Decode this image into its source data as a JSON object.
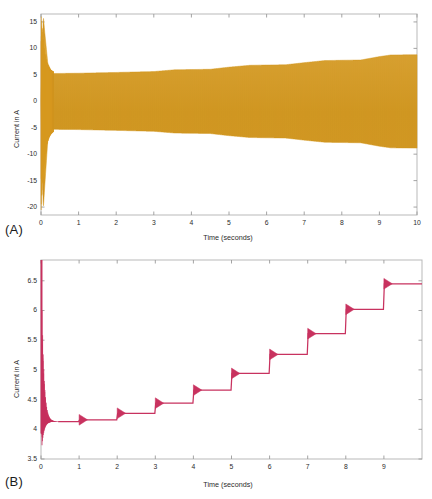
{
  "figure": {
    "background": "#ffffff",
    "panels": [
      {
        "letter": "(A)",
        "name": "panel-a"
      },
      {
        "letter": "(B)",
        "name": "panel-b"
      }
    ]
  },
  "chart_data": [
    {
      "type": "line",
      "panel": "A",
      "title": "",
      "xlabel": "Time (seconds)",
      "ylabel": "Current in A",
      "xlim": [
        0,
        10
      ],
      "ylim": [
        -21.5,
        16.5
      ],
      "xticks": [
        0,
        1,
        2,
        3,
        4,
        5,
        6,
        7,
        8,
        9,
        10
      ],
      "xtick_labels": [
        "0",
        "1",
        "2",
        "3",
        "4",
        "5",
        "6",
        "7",
        "8",
        "9",
        "10"
      ],
      "yticks": [
        15,
        10,
        5,
        0,
        -5,
        -10,
        -15,
        -20
      ],
      "ytick_labels": [
        "15",
        "10",
        "5",
        "0",
        "-5",
        "-10",
        "-15",
        "-20"
      ],
      "grid": false,
      "series": [
        {
          "name": "phase-current",
          "color": "#d79a22",
          "description": "High-frequency sinusoidal phase current, dense oscillation filling the envelope",
          "envelope_upper_x": [
            0.0,
            0.06,
            0.1,
            0.18,
            0.3,
            1.0,
            2.0,
            3.0,
            3.55,
            4.0,
            4.5,
            5.0,
            5.55,
            6.0,
            6.5,
            7.0,
            7.55,
            8.0,
            8.5,
            9.0,
            9.3,
            10.0
          ],
          "envelope_upper_y": [
            0.0,
            16.2,
            13.0,
            7.2,
            5.25,
            5.3,
            5.45,
            5.62,
            5.95,
            6.0,
            6.05,
            6.45,
            6.8,
            6.85,
            6.9,
            7.3,
            7.7,
            7.75,
            7.8,
            8.45,
            8.75,
            8.8
          ],
          "envelope_lower_x": [
            0.0,
            0.06,
            0.1,
            0.18,
            0.3,
            1.0,
            2.0,
            3.0,
            3.55,
            4.0,
            4.5,
            5.0,
            5.55,
            6.0,
            6.5,
            7.0,
            7.55,
            8.0,
            8.5,
            9.0,
            9.3,
            10.0
          ],
          "envelope_lower_y": [
            0.0,
            -20.5,
            -16.0,
            -7.4,
            -5.3,
            -5.35,
            -5.5,
            -5.68,
            -6.0,
            -6.05,
            -6.1,
            -6.5,
            -6.85,
            -6.9,
            -6.95,
            -7.35,
            -7.75,
            -7.8,
            -7.85,
            -8.5,
            -8.8,
            -8.85
          ]
        }
      ]
    },
    {
      "type": "line",
      "panel": "B",
      "title": "",
      "xlabel": "Time (seconds)",
      "ylabel": "Current in A",
      "xlim": [
        0,
        10
      ],
      "ylim": [
        3.5,
        6.85
      ],
      "xticks": [
        0,
        1,
        2,
        3,
        4,
        5,
        6,
        7,
        8,
        9
      ],
      "xtick_labels": [
        "0",
        "1",
        "2",
        "3",
        "4",
        "5",
        "6",
        "7",
        "8",
        "9"
      ],
      "yticks": [
        6.5,
        6,
        5.5,
        5,
        4.5,
        4,
        3.5
      ],
      "ytick_labels": [
        "6.5",
        "6",
        "5.5",
        "5",
        "4.5",
        "4",
        "3.5"
      ],
      "grid": false,
      "series": [
        {
          "name": "rms-current",
          "color": "#c8325f",
          "description": "RMS current: large start-up transient then staircase steps once per second",
          "steps_time": [
            0,
            1,
            2,
            3,
            4,
            5,
            6,
            7,
            8,
            9
          ],
          "steps_value": [
            4.13,
            4.16,
            4.27,
            4.44,
            4.66,
            4.94,
            5.26,
            5.61,
            6.02,
            6.45
          ],
          "startup_peak": 6.85,
          "startup_min": 3.55,
          "settle_time": 0.45,
          "transient_spike_up": 0.09,
          "transient_spike_down": 0.09
        }
      ]
    }
  ]
}
